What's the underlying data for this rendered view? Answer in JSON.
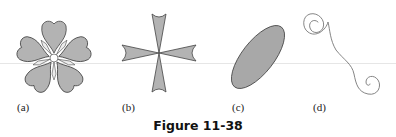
{
  "figure": {
    "caption": "Figure 11-38",
    "fill_color": "#b3b3b3",
    "stroke_color": "#444444",
    "panels": [
      {
        "id": "a",
        "label": "(a)",
        "shape": "five-petal-flower"
      },
      {
        "id": "b",
        "label": "(b)",
        "shape": "four-armed-cross-concave-ends"
      },
      {
        "id": "c",
        "label": "(c)",
        "shape": "tilted-filled-ellipse"
      },
      {
        "id": "d",
        "label": "(d)",
        "shape": "s-curve-spiral-ends"
      }
    ]
  }
}
